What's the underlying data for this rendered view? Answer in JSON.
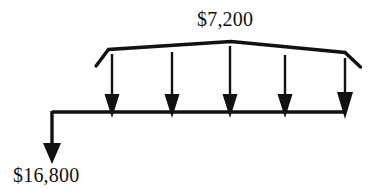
{
  "diagram": {
    "type": "cash-flow-diagram",
    "title": "",
    "stroke_color": "#111111",
    "background_color": "#ffffff",
    "timeline": {
      "orientation": "horizontal",
      "x_start": 52,
      "x_end": 346,
      "y": 112
    },
    "receipt": {
      "label": "$7,200",
      "direction": "down",
      "count": 5,
      "bracket": {
        "left_corner_x": 108,
        "left_corner_y": 49,
        "left_tail_x": 96,
        "left_tail_y": 65,
        "peak_x": 231,
        "peak_y": 41,
        "right_corner_x": 345,
        "right_corner_y": 52,
        "right_tail_x": 360,
        "right_tail_y": 66
      },
      "arrow_x_positions": [
        112,
        172,
        230,
        285,
        345
      ]
    },
    "payment": {
      "label": "$16,800",
      "direction": "down",
      "x": 52,
      "y_start": 112,
      "y_tip": 162
    }
  }
}
